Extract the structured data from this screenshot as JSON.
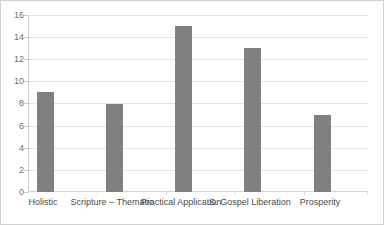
{
  "chart_data": {
    "type": "bar",
    "title": "",
    "subtitle": "",
    "xlabel": "",
    "ylabel": "",
    "categories": [
      "Holistic",
      "Scripture – Thematic",
      "Practical Application",
      "S. Gospel Liberation",
      "Prosperity"
    ],
    "values": [
      9,
      8,
      15,
      13,
      7
    ],
    "ylim": [
      0,
      16
    ],
    "ytick_step": 2,
    "yticks": [
      16,
      14,
      12,
      10,
      8,
      6,
      4,
      2,
      0
    ],
    "grid": true,
    "legend": false,
    "legend_position": "none",
    "bar_color": "#808080",
    "gridline_color": "#e2e2e2",
    "axis_color": "#c9c9c9",
    "tick_label_color": "#6f6f6f",
    "category_label_color": "#4a4a4a",
    "plot_background": "#ffffff",
    "border_color": "#d0d0d0"
  }
}
